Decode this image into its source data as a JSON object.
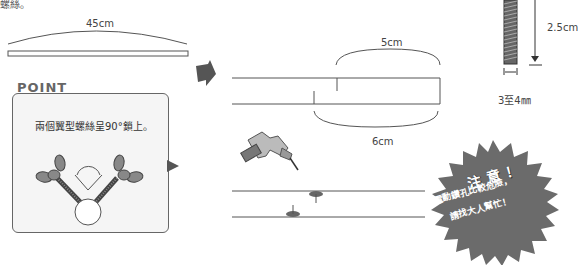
{
  "header_fragment": "螺絲。",
  "step1": {
    "stick_length_label": "45cm"
  },
  "point": {
    "title": "POINT",
    "text": "兩個翼型螺絲呈90°鎖上。"
  },
  "step2": {
    "top_measure_label": "5cm",
    "bottom_measure_label": "6cm"
  },
  "screw": {
    "length_label": "2.5cm",
    "width_label": "3至4㎜"
  },
  "warning": {
    "title": "注意！",
    "line1": "電動鑽孔比較危險，",
    "line2": "請找大人幫忙！"
  },
  "colors": {
    "line": "#555555",
    "arrow": "#555555",
    "starburst": "#6b6b6b",
    "point_border": "#666666",
    "point_bg": "#f5f5f5"
  }
}
